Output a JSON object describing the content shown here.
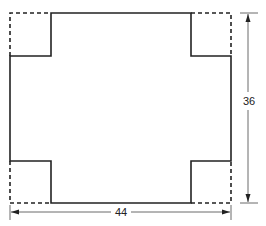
{
  "diagram": {
    "dimensions": {
      "width_label": "44",
      "height_label": "36"
    },
    "line_styles": {
      "cut_outline": "solid",
      "removed_corners": "dashed"
    }
  }
}
